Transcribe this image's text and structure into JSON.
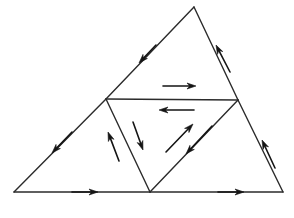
{
  "canvas": {
    "width": 294,
    "height": 218,
    "background": "#ffffff",
    "title": "Subdivided triangle with directed edges"
  },
  "style": {
    "stroke_color": "#2b2b2b",
    "stroke_width": 1.4,
    "arrow_color": "#141414",
    "arrow_stroke_width": 1.6,
    "arrow_head_length": 9,
    "arrow_head_width": 6
  },
  "chart_data": {
    "type": "diagram",
    "vertices": [
      {
        "id": "A",
        "label": "apex",
        "x": 194,
        "y": 7
      },
      {
        "id": "B",
        "label": "bottom-left",
        "x": 14,
        "y": 192
      },
      {
        "id": "C",
        "label": "bottom-right",
        "x": 283,
        "y": 192
      },
      {
        "id": "M_AB",
        "label": "left-midpoint",
        "x": 106,
        "y": 99
      },
      {
        "id": "M_AC",
        "label": "right-midpoint",
        "x": 238,
        "y": 100
      },
      {
        "id": "M_BC",
        "label": "bottom-midpoint",
        "x": 150,
        "y": 192
      }
    ],
    "edges": [
      {
        "id": "edge-apex-to-left-mid",
        "from": "A",
        "to": "M_AB",
        "x1": 194,
        "y1": 7,
        "x2": 106,
        "y2": 99
      },
      {
        "id": "edge-left-mid-to-bottom-left",
        "from": "M_AB",
        "to": "B",
        "x1": 106,
        "y1": 99,
        "x2": 14,
        "y2": 192
      },
      {
        "id": "edge-apex-to-right-mid",
        "from": "A",
        "to": "M_AC",
        "x1": 194,
        "y1": 7,
        "x2": 238,
        "y2": 100
      },
      {
        "id": "edge-right-mid-to-bottom-right",
        "from": "M_AC",
        "to": "C",
        "x1": 238,
        "y1": 100,
        "x2": 283,
        "y2": 192
      },
      {
        "id": "edge-bottom-left-to-bottom-mid",
        "from": "B",
        "to": "M_BC",
        "x1": 14,
        "y1": 192,
        "x2": 150,
        "y2": 192
      },
      {
        "id": "edge-bottom-mid-to-bottom-right",
        "from": "M_BC",
        "to": "C",
        "x1": 150,
        "y1": 192,
        "x2": 283,
        "y2": 192
      },
      {
        "id": "edge-midsegment-horizontal",
        "from": "M_AB",
        "to": "M_AC",
        "x1": 106,
        "y1": 99,
        "x2": 238,
        "y2": 100
      },
      {
        "id": "edge-left-mid-to-bottom-mid",
        "from": "M_AB",
        "to": "M_BC",
        "x1": 106,
        "y1": 99,
        "x2": 150,
        "y2": 192
      },
      {
        "id": "edge-bottom-mid-to-right-mid",
        "from": "M_BC",
        "to": "M_AC",
        "x1": 150,
        "y1": 192,
        "x2": 238,
        "y2": 100
      }
    ],
    "arrows": [
      {
        "id": "arrow-upper-left-edge",
        "on_edge": "edge-apex-to-left-mid",
        "direction": "down-left",
        "placement": "on-line",
        "x1": 156,
        "y1": 45,
        "x2": 139,
        "y2": 63
      },
      {
        "id": "arrow-upper-right-edge",
        "on_edge": "edge-apex-to-right-mid",
        "direction": "up-right",
        "placement": "on-line",
        "x1": 230,
        "y1": 72,
        "x2": 216,
        "y2": 45
      },
      {
        "id": "arrow-lower-left-edge",
        "on_edge": "edge-left-mid-to-bottom-left",
        "direction": "down-left",
        "placement": "on-line",
        "x1": 72,
        "y1": 132,
        "x2": 52,
        "y2": 153
      },
      {
        "id": "arrow-lower-right-edge",
        "on_edge": "edge-right-mid-to-bottom-right",
        "direction": "up-right",
        "placement": "on-line",
        "x1": 275,
        "y1": 168,
        "x2": 262,
        "y2": 140
      },
      {
        "id": "arrow-bottom-left-segment",
        "on_edge": "edge-bottom-left-to-bottom-mid",
        "direction": "right",
        "placement": "on-line",
        "x1": 72,
        "y1": 192,
        "x2": 98,
        "y2": 192
      },
      {
        "id": "arrow-bottom-right-segment",
        "on_edge": "edge-bottom-mid-to-bottom-right",
        "direction": "right",
        "placement": "on-line",
        "x1": 218,
        "y1": 192,
        "x2": 244,
        "y2": 192
      },
      {
        "id": "arrow-midsegment-above-right",
        "on_edge": "edge-midsegment-horizontal",
        "direction": "right",
        "placement": "above",
        "x1": 163,
        "y1": 86,
        "x2": 196,
        "y2": 86
      },
      {
        "id": "arrow-midsegment-below-left",
        "on_edge": "edge-midsegment-horizontal",
        "direction": "left",
        "placement": "below",
        "x1": 194,
        "y1": 110,
        "x2": 159,
        "y2": 110
      },
      {
        "id": "arrow-left-diagonal-up",
        "on_edge": "edge-left-mid-to-bottom-mid",
        "direction": "up-left",
        "placement": "left-of-line",
        "x1": 119,
        "y1": 161,
        "x2": 108,
        "y2": 132
      },
      {
        "id": "arrow-left-diagonal-down",
        "on_edge": "edge-left-mid-to-bottom-mid",
        "direction": "down-right",
        "placement": "right-of-line",
        "x1": 133,
        "y1": 122,
        "x2": 143,
        "y2": 150
      },
      {
        "id": "arrow-right-diagonal-up",
        "on_edge": "edge-bottom-mid-to-right-mid",
        "direction": "up-right",
        "placement": "left-of-line",
        "x1": 166,
        "y1": 152,
        "x2": 193,
        "y2": 124
      },
      {
        "id": "arrow-right-diagonal-down",
        "on_edge": "edge-bottom-mid-to-right-mid",
        "direction": "down-left",
        "placement": "right-of-line",
        "x1": 212,
        "y1": 126,
        "x2": 186,
        "y2": 154
      }
    ],
    "faces": [
      {
        "id": "face-top",
        "vertices": [
          "A",
          "M_AB",
          "M_AC"
        ]
      },
      {
        "id": "face-left",
        "vertices": [
          "M_AB",
          "B",
          "M_BC"
        ]
      },
      {
        "id": "face-center",
        "vertices": [
          "M_AB",
          "M_BC",
          "M_AC"
        ]
      },
      {
        "id": "face-right",
        "vertices": [
          "M_BC",
          "C",
          "M_AC"
        ]
      }
    ]
  }
}
